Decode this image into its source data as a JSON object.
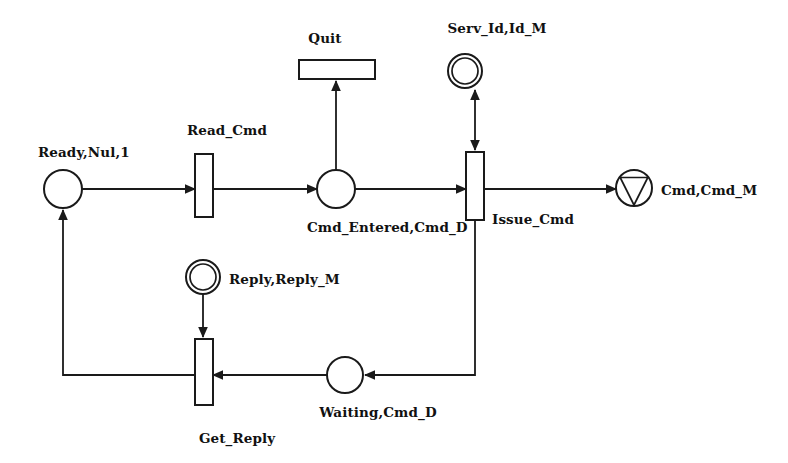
{
  "diagram": {
    "type": "petri-net",
    "canvas": {
      "width": 788,
      "height": 463
    },
    "colors": {
      "stroke": "#1a1a1a",
      "fill": "#ffffff",
      "text": "#111111",
      "background": "#ffffff"
    },
    "places": [
      {
        "id": "ready",
        "label": "Ready,Nul,1",
        "shape": "circle",
        "cx": 63,
        "cy": 189,
        "r": 19,
        "label_x": 38,
        "label_y": 157,
        "label_anchor": "start"
      },
      {
        "id": "cmd-entered",
        "label": "Cmd_Entered,Cmd_D",
        "shape": "circle",
        "cx": 336,
        "cy": 189,
        "r": 19,
        "label_x": 307,
        "label_y": 232,
        "label_anchor": "start"
      },
      {
        "id": "serv-id",
        "label": "Serv_Id,Id_M",
        "shape": "double-circle",
        "cx": 465,
        "cy": 71,
        "r": 17,
        "r_inner": 13,
        "label_x": 452,
        "label_y": 33,
        "label_anchor": "middle"
      },
      {
        "id": "cmd-out",
        "label": "Cmd,Cmd_M",
        "shape": "circle-triangle",
        "cx": 634,
        "cy": 188,
        "r": 18,
        "label_x": 660,
        "label_y": 195,
        "label_anchor": "start"
      },
      {
        "id": "reply",
        "label": "Reply,Reply_M",
        "shape": "double-circle",
        "cx": 203,
        "cy": 277,
        "r": 17,
        "r_inner": 13,
        "label_x": 229,
        "label_y": 284,
        "label_anchor": "start"
      },
      {
        "id": "waiting",
        "label": "Waiting,Cmd_D",
        "shape": "circle",
        "cx": 345,
        "cy": 375,
        "r": 18,
        "label_x": 345,
        "label_y": 417,
        "label_anchor": "middle"
      }
    ],
    "transitions": [
      {
        "id": "read-cmd",
        "label": "Read_Cmd",
        "orientation": "vertical",
        "x": 195,
        "y": 154,
        "w": 18,
        "h": 63,
        "label_x": 183,
        "label_y": 135,
        "label_anchor": "middle"
      },
      {
        "id": "quit",
        "label": "Quit",
        "orientation": "horizontal",
        "x": 299,
        "y": 60,
        "w": 76,
        "h": 19,
        "label_x": 325,
        "label_y": 43,
        "label_anchor": "middle"
      },
      {
        "id": "issue-cmd",
        "label": "Issue_Cmd",
        "orientation": "vertical",
        "x": 466,
        "y": 152,
        "w": 18,
        "h": 68,
        "label_x": 492,
        "label_y": 224,
        "label_anchor": "start"
      },
      {
        "id": "get-reply",
        "label": "Get_Reply",
        "orientation": "vertical",
        "x": 195,
        "y": 339,
        "w": 18,
        "h": 66,
        "label_x": 204,
        "label_y": 443,
        "label_anchor": "middle"
      }
    ],
    "arcs": [
      {
        "id": "ready-to-read-cmd",
        "from": "ready",
        "to": "read-cmd",
        "kind": "directed",
        "points": "82,189 195,189",
        "arrow_at": "195,189",
        "arrow_dir": "right"
      },
      {
        "id": "read-cmd-to-cmd-entered",
        "from": "read-cmd",
        "to": "cmd-entered",
        "kind": "directed",
        "points": "213,189 317,189",
        "arrow_at": "317,189",
        "arrow_dir": "right"
      },
      {
        "id": "cmd-entered-to-quit",
        "from": "cmd-entered",
        "to": "quit",
        "kind": "directed",
        "points": "336,170 336,79",
        "arrow_at": "336,79",
        "arrow_dir": "up"
      },
      {
        "id": "cmd-entered-to-issue-cmd",
        "from": "cmd-entered",
        "to": "issue-cmd",
        "kind": "directed",
        "points": "355,189 466,189",
        "arrow_at": "466,189",
        "arrow_dir": "right"
      },
      {
        "id": "issue-cmd-serv-id",
        "from": "issue-cmd",
        "to": "serv-id",
        "kind": "bidirectional",
        "points": "475,152 475,88",
        "arrow_at": "475,88",
        "arrow_dir": "up",
        "arrow_at2": "475,152",
        "arrow_dir2": "down"
      },
      {
        "id": "issue-cmd-to-cmd-out",
        "from": "issue-cmd",
        "to": "cmd-out",
        "kind": "directed",
        "points": "484,189 616,189",
        "arrow_at": "616,189",
        "arrow_dir": "right"
      },
      {
        "id": "issue-cmd-to-waiting",
        "from": "issue-cmd",
        "to": "waiting",
        "kind": "directed",
        "points": "475,220 475,375 363,375",
        "arrow_at": "363,375",
        "arrow_dir": "left"
      },
      {
        "id": "waiting-to-get-reply",
        "from": "waiting",
        "to": "get-reply",
        "kind": "directed",
        "points": "327,375 213,375",
        "arrow_at": "213,375",
        "arrow_dir": "left"
      },
      {
        "id": "reply-to-get-reply",
        "from": "reply",
        "to": "get-reply",
        "kind": "directed",
        "points": "203,294 203,339",
        "arrow_at": "203,339",
        "arrow_dir": "down"
      },
      {
        "id": "get-reply-to-ready",
        "from": "get-reply",
        "to": "ready",
        "kind": "directed",
        "points": "195,375 63,375 63,208",
        "arrow_at": "63,208",
        "arrow_dir": "up"
      }
    ]
  }
}
